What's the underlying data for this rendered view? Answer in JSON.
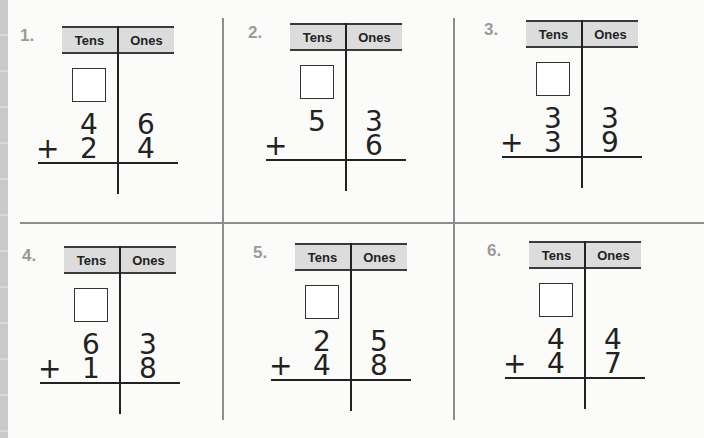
{
  "worksheet": {
    "header_tens": "Tens",
    "header_ones": "Ones",
    "operator": "+",
    "problems": [
      {
        "label": "1.",
        "top_tens": "4",
        "top_ones": "6",
        "bottom_tens": "2",
        "bottom_ones": "4"
      },
      {
        "label": "2.",
        "top_tens": "5",
        "top_ones": "3",
        "bottom_tens": "",
        "bottom_ones": "6"
      },
      {
        "label": "3.",
        "top_tens": "3",
        "top_ones": "3",
        "bottom_tens": "3",
        "bottom_ones": "9"
      },
      {
        "label": "4.",
        "top_tens": "6",
        "top_ones": "3",
        "bottom_tens": "1",
        "bottom_ones": "8"
      },
      {
        "label": "5.",
        "top_tens": "2",
        "top_ones": "5",
        "bottom_tens": "4",
        "bottom_ones": "8"
      },
      {
        "label": "6.",
        "top_tens": "4",
        "top_ones": "4",
        "bottom_tens": "4",
        "bottom_ones": "7"
      }
    ]
  }
}
